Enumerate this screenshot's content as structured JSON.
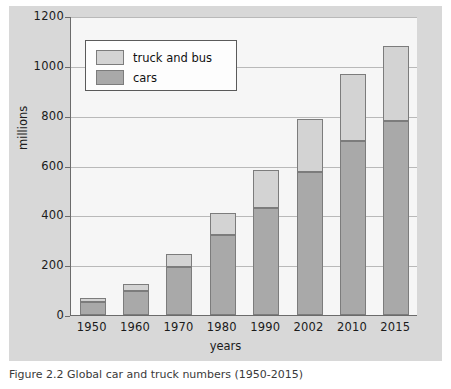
{
  "figure": {
    "caption": "Figure 2.2  Global car and truck numbers (1950-2015)",
    "background_color": "#d8d8d8",
    "plot_background_color": "#f6f6f6"
  },
  "legend": {
    "position": "top-left-inside",
    "entries": [
      {
        "label": "truck and bus",
        "color": "#d3d3d3",
        "swatch_name": "legend-swatch-truck-and-bus"
      },
      {
        "label": "cars",
        "color": "#a9a9a9",
        "swatch_name": "legend-swatch-cars"
      }
    ]
  },
  "chart_data": {
    "type": "bar",
    "stacked": true,
    "title": "",
    "xlabel": "years",
    "ylabel": "millions",
    "ylim": [
      0,
      1200
    ],
    "yticks": [
      0,
      200,
      400,
      600,
      800,
      1000,
      1200
    ],
    "ytick_labels": [
      "0",
      "200",
      "400",
      "600",
      "800",
      "1000",
      "1200"
    ],
    "grid": true,
    "grid_axis": "y",
    "categories": [
      "1950",
      "1960",
      "1970",
      "1980",
      "1990",
      "2002",
      "2010",
      "2015"
    ],
    "series": [
      {
        "name": "cars",
        "color": "#a9a9a9",
        "values": [
          53,
          98,
          193,
          320,
          430,
          575,
          700,
          780
        ]
      },
      {
        "name": "truck and bus",
        "color": "#d3d3d3",
        "values": [
          17,
          27,
          52,
          88,
          153,
          210,
          268,
          300
        ]
      }
    ],
    "totals": [
      70,
      125,
      245,
      408,
      583,
      785,
      968,
      1080
    ]
  }
}
